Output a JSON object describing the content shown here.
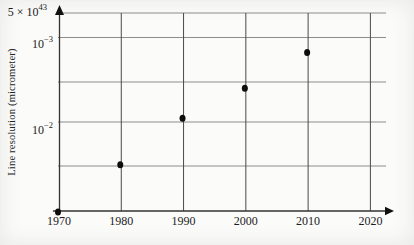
{
  "figure": {
    "y_axis_title": "Line resolution (micrometer)",
    "y_tick_top": {
      "prefix": "5 × 10",
      "exp": "43"
    },
    "y_tick_mid": {
      "prefix": "10",
      "exp": "−3"
    },
    "y_tick_low": {
      "prefix": "10",
      "exp": "−2"
    }
  },
  "chart_data": {
    "type": "scatter",
    "title": "",
    "xlabel": "",
    "ylabel": "Line resolution (micrometer)",
    "x_tick_labels": [
      "1970",
      "1980",
      "1990",
      "2000",
      "2010",
      "2020"
    ],
    "y_tick_labels_top_to_bottom": [
      "5 × 10⁴³",
      "10⁻³",
      "10⁻²"
    ],
    "y_scale": "logarithmic, values decrease upward",
    "x_range": [
      1970,
      2020
    ],
    "grid": "on",
    "legend": "none",
    "series": [
      {
        "name": "line-resolution-points",
        "points": [
          {
            "year": 1970,
            "value_um_est": 0.12
          },
          {
            "year": 1980,
            "value_um_est": 0.032
          },
          {
            "year": 1990,
            "value_um_est": 0.009
          },
          {
            "year": 2000,
            "value_um_est": 0.004
          },
          {
            "year": 2010,
            "value_um_est": 0.0015
          }
        ]
      }
    ]
  }
}
